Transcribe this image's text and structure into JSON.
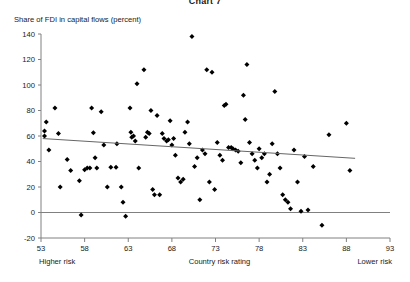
{
  "title": "Chart 7",
  "chart_data": {
    "type": "scatter",
    "title": "Chart 7",
    "ylabel": "Share of FDI in capital flows (percent)",
    "xlabel": "Country risk rating",
    "xlabel_left": "Higher risk",
    "xlabel_right": "Lower risk",
    "xlim": [
      53,
      93
    ],
    "ylim": [
      -20,
      140
    ],
    "xticks": [
      53,
      58,
      63,
      68,
      73,
      78,
      83,
      88,
      93
    ],
    "yticks": [
      -20,
      0,
      20,
      40,
      60,
      80,
      100,
      120,
      140
    ],
    "grid": false,
    "legend": null,
    "marker": "diamond",
    "marker_color": "#000000",
    "axis_color": "#808080",
    "zero_line": 0,
    "trendline": {
      "label": "linear fit",
      "color": "#666666",
      "x_start": 53.2,
      "y_start": 58.0,
      "x_end": 89.0,
      "y_end": 42.5
    },
    "points": [
      [
        53.4,
        64.0
      ],
      [
        53.4,
        60.0
      ],
      [
        53.6,
        71.0
      ],
      [
        53.9,
        49.0
      ],
      [
        54.6,
        82.0
      ],
      [
        55.0,
        62.0
      ],
      [
        55.2,
        20.0
      ],
      [
        56.0,
        41.5
      ],
      [
        56.4,
        33.0
      ],
      [
        57.4,
        25.0
      ],
      [
        57.6,
        -2.0
      ],
      [
        58.0,
        33.5
      ],
      [
        58.3,
        35.0
      ],
      [
        58.6,
        35.0
      ],
      [
        58.8,
        82.0
      ],
      [
        59.0,
        62.5
      ],
      [
        59.2,
        43.0
      ],
      [
        59.4,
        35.0
      ],
      [
        59.9,
        79.0
      ],
      [
        60.2,
        53.0
      ],
      [
        60.6,
        20.0
      ],
      [
        61.0,
        35.5
      ],
      [
        61.6,
        35.5
      ],
      [
        61.7,
        54.0
      ],
      [
        62.2,
        20.0
      ],
      [
        62.4,
        8.0
      ],
      [
        62.7,
        -3.0
      ],
      [
        63.2,
        82.0
      ],
      [
        63.3,
        63.0
      ],
      [
        63.4,
        59.0
      ],
      [
        63.6,
        60.0
      ],
      [
        63.8,
        56.0
      ],
      [
        64.0,
        101.0
      ],
      [
        64.2,
        35.0
      ],
      [
        64.8,
        112.0
      ],
      [
        65.0,
        59.0
      ],
      [
        65.2,
        63.0
      ],
      [
        65.4,
        62.0
      ],
      [
        65.6,
        80.0
      ],
      [
        65.8,
        18.0
      ],
      [
        66.0,
        14.0
      ],
      [
        66.3,
        76.0
      ],
      [
        66.6,
        14.0
      ],
      [
        66.9,
        62.0
      ],
      [
        67.1,
        58.0
      ],
      [
        67.4,
        56.0
      ],
      [
        67.6,
        57.0
      ],
      [
        67.8,
        72.0
      ],
      [
        68.0,
        53.0
      ],
      [
        68.2,
        58.0
      ],
      [
        68.4,
        45.0
      ],
      [
        68.7,
        27.0
      ],
      [
        69.0,
        24.0
      ],
      [
        69.3,
        26.0
      ],
      [
        69.5,
        63.0
      ],
      [
        69.8,
        71.0
      ],
      [
        70.0,
        54.0
      ],
      [
        70.3,
        138.0
      ],
      [
        70.6,
        36.0
      ],
      [
        70.9,
        43.0
      ],
      [
        71.2,
        10.0
      ],
      [
        71.5,
        49.0
      ],
      [
        71.8,
        46.0
      ],
      [
        72.0,
        112.0
      ],
      [
        72.3,
        24.0
      ],
      [
        72.6,
        110.0
      ],
      [
        72.9,
        18.0
      ],
      [
        73.2,
        55.0
      ],
      [
        73.5,
        45.0
      ],
      [
        73.8,
        41.0
      ],
      [
        74.0,
        84.0
      ],
      [
        74.2,
        85.0
      ],
      [
        74.5,
        51.0
      ],
      [
        74.8,
        51.0
      ],
      [
        75.0,
        50.0
      ],
      [
        75.3,
        49.0
      ],
      [
        75.6,
        48.0
      ],
      [
        75.9,
        39.0
      ],
      [
        76.2,
        92.0
      ],
      [
        76.4,
        73.0
      ],
      [
        76.6,
        116.0
      ],
      [
        76.9,
        55.0
      ],
      [
        77.2,
        46.0
      ],
      [
        77.5,
        41.0
      ],
      [
        77.8,
        35.0
      ],
      [
        78.0,
        50.0
      ],
      [
        78.3,
        43.0
      ],
      [
        78.6,
        46.0
      ],
      [
        78.9,
        24.0
      ],
      [
        79.2,
        30.0
      ],
      [
        79.5,
        54.0
      ],
      [
        79.8,
        95.0
      ],
      [
        80.1,
        46.0
      ],
      [
        80.4,
        35.0
      ],
      [
        80.7,
        14.0
      ],
      [
        81.0,
        10.0
      ],
      [
        81.3,
        8.0
      ],
      [
        81.6,
        3.0
      ],
      [
        82.0,
        49.0
      ],
      [
        82.4,
        24.0
      ],
      [
        82.8,
        1.0
      ],
      [
        83.2,
        44.0
      ],
      [
        83.6,
        2.0
      ],
      [
        84.2,
        36.0
      ],
      [
        85.2,
        -10.0
      ],
      [
        86.0,
        61.0
      ],
      [
        88.0,
        70.0
      ],
      [
        88.4,
        33.0
      ]
    ]
  }
}
